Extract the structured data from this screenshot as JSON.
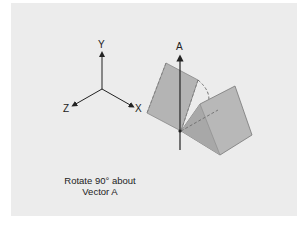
{
  "diagram": {
    "axes": {
      "y_label": "Y",
      "x_label": "X",
      "z_label": "Z"
    },
    "vector_label": "A",
    "caption_line1": "Rotate 90° about",
    "caption_line2": "Vector A",
    "colors": {
      "background": "#ffffff",
      "panel": "#ececec",
      "plane_fill": "#b4b4b4",
      "plane_stroke": "#777777",
      "axis": "#222222"
    }
  }
}
